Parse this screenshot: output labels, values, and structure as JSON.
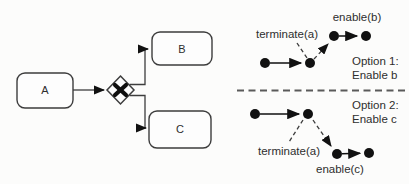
{
  "process_diagram": {
    "tasks": [
      {
        "label": "A"
      },
      {
        "label": "B"
      },
      {
        "label": "C"
      }
    ],
    "gateway": {
      "type": "xor-exclusive-gateway",
      "symbol": "X"
    }
  },
  "traces": {
    "option1": {
      "terminate_label": "terminate(a)",
      "enable_label": "enable(b)",
      "caption_line1": "Option 1:",
      "caption_line2": "Enable b"
    },
    "option2": {
      "terminate_label": "terminate(a)",
      "enable_label": "enable(c)",
      "caption_line1": "Option 2:",
      "caption_line2": "Enable c"
    }
  },
  "colors": {
    "line": "#3d3d3d",
    "dot": "#111111",
    "text": "#2e2e2e",
    "divider": "#5a5a5a",
    "background": "#fcfcfb"
  }
}
